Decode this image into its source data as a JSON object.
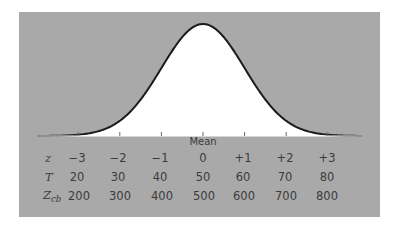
{
  "chart_data": {
    "type": "line",
    "title": "",
    "mean_label": "Mean",
    "xlabel": "",
    "ylabel": "",
    "grid": false,
    "scales": [
      {
        "name": "z",
        "label": "z",
        "values": [
          "−3",
          "−2",
          "−1",
          "0",
          "+1",
          "+2",
          "+3"
        ]
      },
      {
        "name": "T",
        "label": "T",
        "values": [
          "20",
          "30",
          "40",
          "50",
          "60",
          "70",
          "80"
        ]
      },
      {
        "name": "Zcb",
        "label": "Z",
        "subscript": "cb",
        "values": [
          "200",
          "300",
          "400",
          "500",
          "600",
          "700",
          "800"
        ]
      }
    ],
    "x": [
      -3,
      -2,
      -1,
      0,
      1,
      2,
      3
    ],
    "colors": {
      "panel": "#a9a9a9",
      "under_curve": "#ffffff",
      "line": "#1a1a1a",
      "text": "#3b3b3b"
    }
  }
}
